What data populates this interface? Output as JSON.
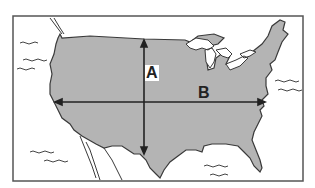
{
  "diagram": {
    "labels": {
      "vertical_arrow": "A",
      "horizontal_arrow": "B"
    },
    "colors": {
      "land": "#b4b4b4",
      "water": "#ffffff",
      "outline": "#3a3a3a",
      "frame": "#555555"
    }
  }
}
